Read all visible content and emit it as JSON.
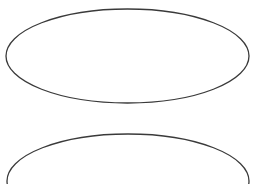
{
  "canvas": {
    "width": 259,
    "height": 184,
    "background": "#ffffff"
  },
  "shapes": [
    {
      "type": "ellipse",
      "label": "",
      "cx": 127.5,
      "cy": 56,
      "rx": 121.5,
      "ry": 47,
      "stroke": "#3a3a3a",
      "fill": "#ffffff"
    },
    {
      "type": "ellipse",
      "label": "",
      "cx": 128,
      "cy": 181,
      "rx": 121,
      "ry": 47,
      "stroke": "#3a3a3a",
      "fill": "#ffffff"
    }
  ]
}
